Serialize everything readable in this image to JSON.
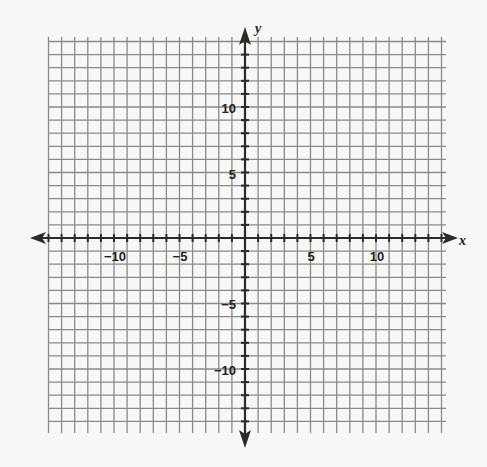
{
  "chart_data": {
    "type": "coordinate-grid",
    "title": "",
    "xlabel": "x",
    "ylabel": "y",
    "xlim": [
      -15,
      15
    ],
    "ylim": [
      -15,
      15
    ],
    "grid": true,
    "grid_step": 1,
    "x_tick_labels": [
      "-10",
      "-5",
      "5",
      "10"
    ],
    "x_tick_values": [
      -10,
      -5,
      5,
      10
    ],
    "y_tick_labels": [
      "10",
      "5",
      "-5",
      "-10"
    ],
    "y_tick_values": [
      10,
      5,
      -5,
      -10
    ],
    "series": [],
    "axes_arrows": true,
    "colors": {
      "grid": "#8a8a8a",
      "axis": "#2a2a2a",
      "background": "#f7f7f5"
    }
  },
  "labels": {
    "x_axis": "x",
    "y_axis": "y",
    "x_ticks": [
      "−10",
      "−5",
      "5",
      "10"
    ],
    "y_ticks": [
      "10",
      "5",
      "−5",
      "−10"
    ]
  }
}
